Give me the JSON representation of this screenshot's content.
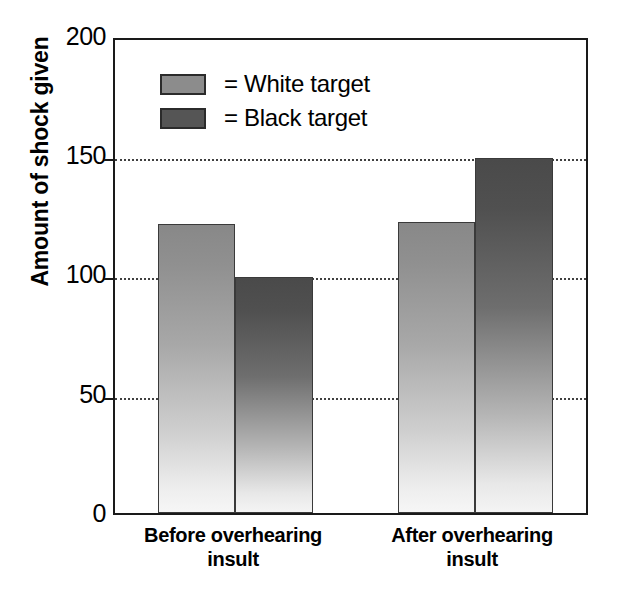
{
  "chart_data": {
    "type": "bar",
    "title": "",
    "xlabel": "",
    "ylabel": "Amount of shock given",
    "ylim": [
      0,
      200
    ],
    "yticks": [
      0,
      50,
      100,
      150,
      200
    ],
    "ytick_labels": [
      "0",
      "50",
      "100",
      "150",
      "200"
    ],
    "grid": "horizontal dotted gridlines at 50, 100, 150",
    "legend_position": "upper-left inside plot area",
    "categories": [
      "Before overhearing insult",
      "After overhearing insult"
    ],
    "category_lines": [
      [
        "Before overhearing",
        "insult"
      ],
      [
        "After overhearing",
        "insult"
      ]
    ],
    "series": [
      {
        "name": "= White target",
        "label": "White target",
        "color": "#8c8c8c",
        "values": [
          122,
          123
        ]
      },
      {
        "name": "= Black target",
        "label": "Black target",
        "color": "#555555",
        "values": [
          100,
          150
        ]
      }
    ]
  },
  "axis": {
    "y_title": "Amount of shock given",
    "y_tick_200": "200",
    "y_tick_150": "150",
    "y_tick_100": "100",
    "y_tick_50": "50",
    "y_tick_0": "0"
  },
  "legend": {
    "rows": [
      {
        "label": "= White target"
      },
      {
        "label": "= Black target"
      }
    ]
  },
  "x_axis": {
    "groups": [
      {
        "line1": "Before overhearing",
        "line2": "insult"
      },
      {
        "line1": "After overhearing",
        "line2": "insult"
      }
    ]
  }
}
